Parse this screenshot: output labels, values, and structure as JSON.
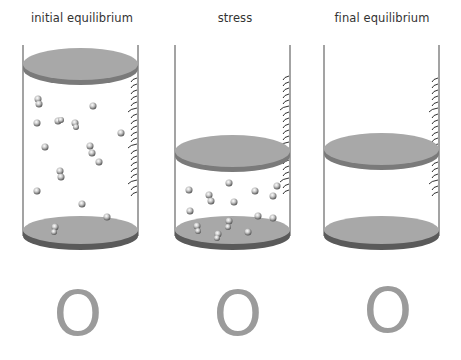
{
  "panels": [
    {
      "title": "initial equilibrium",
      "symbol": "O"
    },
    {
      "title": "stress",
      "symbol": "O"
    },
    {
      "title": "final equilibrium",
      "symbol": "O"
    }
  ],
  "colors": {
    "disc_top": "#a8a8a8",
    "disc_edge": "#7a7a7a",
    "base_edge": "#5a5a5a",
    "wall": "#666666",
    "symbol": "#9b9b9b",
    "text": "#333333"
  }
}
